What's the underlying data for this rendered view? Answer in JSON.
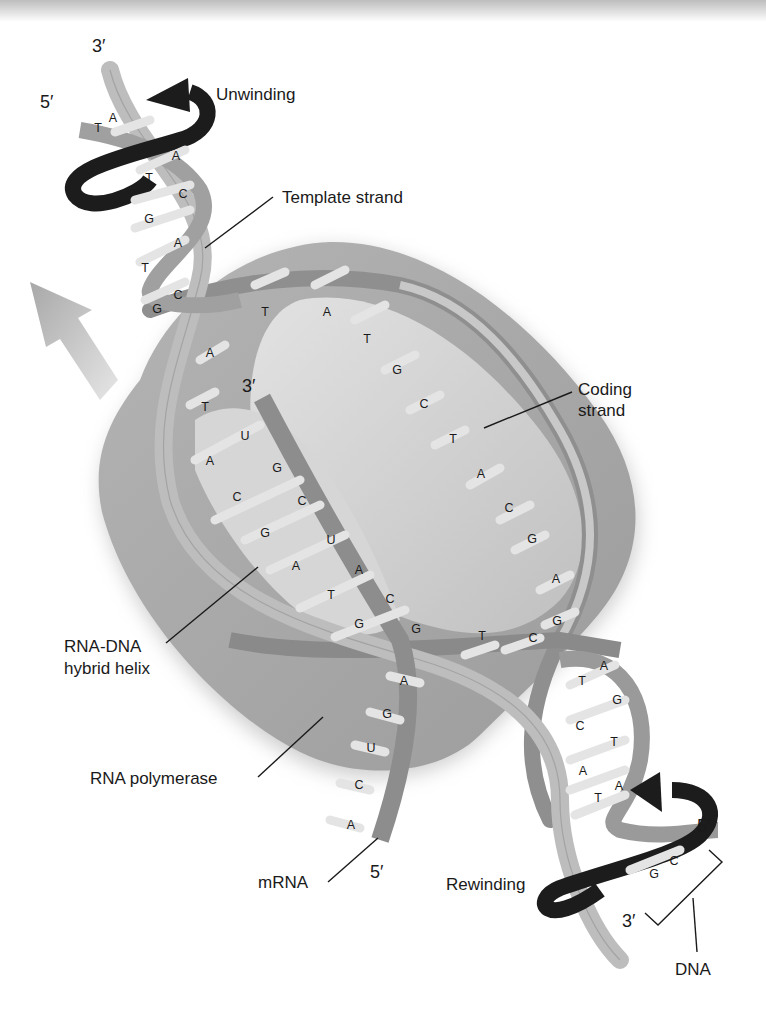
{
  "figure": {
    "colors": {
      "polymerase": "#a9a9a9",
      "polymerase_inner": "#c9c9c9",
      "strand_light": "#bdbdbd",
      "strand_dark": "#8f8f8f",
      "arrow_dark": "#1c1c1c",
      "direction_arrow": "#b5b5b5",
      "text": "#1a1a1a"
    }
  },
  "labels": {
    "unwinding": "Unwinding",
    "template_strand": "Template strand",
    "coding_strand_line1": "Coding",
    "coding_strand_line2": "strand",
    "rna_dna_line1": "RNA-DNA",
    "rna_dna_line2": "hybrid helix",
    "rna_polymerase": "RNA polymerase",
    "mrna": "mRNA",
    "rewinding": "Rewinding",
    "dna": "DNA"
  },
  "ends": {
    "top_3prime": "3′",
    "top_5prime": "5′",
    "rna_3prime": "3′",
    "mrna_5prime": "5′",
    "bottom_5prime": "5′",
    "bottom_3prime": "3′"
  },
  "bases": {
    "upper_helix": [
      "T",
      "A",
      "A",
      "T",
      "C",
      "G",
      "A",
      "T",
      "C",
      "G"
    ],
    "coding_top": [
      "T",
      "A",
      "T",
      "G",
      "C",
      "T",
      "A",
      "C",
      "G",
      "A",
      "G",
      "C"
    ],
    "template_inner": [
      "A",
      "T",
      "A",
      "C",
      "G",
      "A",
      "T",
      "G"
    ],
    "rna_hybrid": [
      "U",
      "G",
      "C",
      "U",
      "A",
      "C",
      "G"
    ],
    "coding_bottom": [
      "T"
    ],
    "mrna_tail": [
      "A",
      "G",
      "U",
      "C",
      "A"
    ],
    "lower_helix": [
      "A",
      "T",
      "G",
      "C",
      "T",
      "A",
      "A",
      "T",
      "C",
      "G"
    ]
  }
}
